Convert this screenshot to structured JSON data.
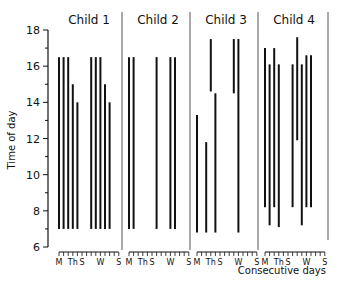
{
  "chart_data": {
    "type": "bar",
    "subtype": "floating-range-bars",
    "title": "",
    "xlabel": "Consecutive days",
    "ylabel": "Time of day",
    "ylim": [
      6,
      18
    ],
    "yticks": [
      6,
      8,
      10,
      12,
      14,
      16,
      18
    ],
    "grid": false,
    "legend": null,
    "days_per_panel": 14,
    "x_tick_labels": [
      {
        "day": 1,
        "label": "M"
      },
      {
        "day": 4,
        "label": "Th"
      },
      {
        "day": 6,
        "label": "S"
      },
      {
        "day": 10,
        "label": "W"
      },
      {
        "day": 14,
        "label": "S"
      }
    ],
    "panels": [
      {
        "name": "Child 1",
        "bars": [
          {
            "day": 1,
            "start": 7.0,
            "end": 16.5
          },
          {
            "day": 2,
            "start": 7.0,
            "end": 16.5
          },
          {
            "day": 3,
            "start": 7.0,
            "end": 16.5
          },
          {
            "day": 4,
            "start": 7.0,
            "end": 15.0
          },
          {
            "day": 5,
            "start": 7.0,
            "end": 14.0
          },
          {
            "day": 8,
            "start": 7.0,
            "end": 16.5
          },
          {
            "day": 9,
            "start": 7.0,
            "end": 16.5
          },
          {
            "day": 10,
            "start": 7.0,
            "end": 16.5
          },
          {
            "day": 11,
            "start": 7.0,
            "end": 15.0
          },
          {
            "day": 12,
            "start": 7.0,
            "end": 14.0
          }
        ]
      },
      {
        "name": "Child 2",
        "bars": [
          {
            "day": 1,
            "start": 7.0,
            "end": 16.5
          },
          {
            "day": 2,
            "start": 7.0,
            "end": 16.5
          },
          {
            "day": 7,
            "start": 7.0,
            "end": 16.5
          },
          {
            "day": 10,
            "start": 7.0,
            "end": 16.5
          },
          {
            "day": 11,
            "start": 7.0,
            "end": 16.5
          }
        ]
      },
      {
        "name": "Child 3",
        "bars": [
          {
            "day": 1,
            "start": 6.8,
            "end": 13.3
          },
          {
            "day": 3,
            "start": 6.8,
            "end": 11.8
          },
          {
            "day": 4,
            "start": 14.6,
            "end": 17.5
          },
          {
            "day": 5,
            "start": 6.8,
            "end": 14.5
          },
          {
            "day": 9,
            "start": 14.5,
            "end": 17.5
          },
          {
            "day": 10,
            "start": 6.8,
            "end": 17.5
          }
        ]
      },
      {
        "name": "Child 4",
        "bars": [
          {
            "day": 1,
            "start": 8.2,
            "end": 17.0
          },
          {
            "day": 2,
            "start": 7.2,
            "end": 16.1
          },
          {
            "day": 3,
            "start": 8.2,
            "end": 17.0
          },
          {
            "day": 4,
            "start": 7.1,
            "end": 16.1
          },
          {
            "day": 7,
            "start": 8.2,
            "end": 16.1
          },
          {
            "day": 8,
            "start": 11.9,
            "end": 17.6
          },
          {
            "day": 9,
            "start": 7.2,
            "end": 16.1
          },
          {
            "day": 10,
            "start": 8.2,
            "end": 16.6
          },
          {
            "day": 11,
            "start": 8.2,
            "end": 16.6
          }
        ]
      }
    ]
  },
  "colors": {
    "ink": "#111111",
    "divider": "#555555",
    "background": "#ffffff"
  }
}
